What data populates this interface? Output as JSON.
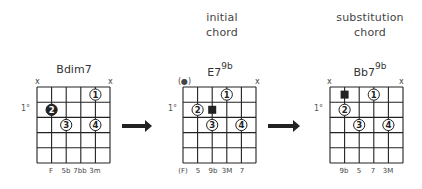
{
  "figure": {
    "arrow_count": 2,
    "colors": {
      "ink": "#222222",
      "background": "#ffffff"
    }
  },
  "diagrams": [
    {
      "id": "bdim7",
      "heading": [],
      "chord_name": "Bdim7",
      "chord_sup": "",
      "fret_label": "1°",
      "top_markers": [
        "x",
        "",
        "",
        "",
        "",
        "x"
      ],
      "bottom_labels": [
        "",
        "F",
        "5b",
        "7bb",
        "3m",
        ""
      ],
      "dots": [
        {
          "string": 4,
          "fret": 1,
          "label": "1",
          "style": "open"
        },
        {
          "string": 1,
          "fret": 2,
          "label": "2",
          "style": "filled"
        },
        {
          "string": 2,
          "fret": 3,
          "label": "3",
          "style": "open"
        },
        {
          "string": 4,
          "fret": 3,
          "label": "4",
          "style": "open"
        }
      ]
    },
    {
      "id": "e7b9",
      "heading": [
        "initial",
        "chord"
      ],
      "chord_name": "E7",
      "chord_sup": "9b",
      "fret_label": "1°",
      "top_markers": [
        "(●)",
        "",
        "",
        "",
        "",
        "x"
      ],
      "bottom_labels": [
        "(F)",
        "5",
        "9b",
        "3M",
        "7",
        ""
      ],
      "dots": [
        {
          "string": 3,
          "fret": 1,
          "label": "1",
          "style": "open"
        },
        {
          "string": 1,
          "fret": 2,
          "label": "2",
          "style": "open"
        },
        {
          "string": 2,
          "fret": 2,
          "label": "",
          "style": "square"
        },
        {
          "string": 2,
          "fret": 3,
          "label": "3",
          "style": "open"
        },
        {
          "string": 4,
          "fret": 3,
          "label": "4",
          "style": "open"
        }
      ]
    },
    {
      "id": "bb7b9",
      "heading": [
        "substitution",
        "chord"
      ],
      "chord_name": "Bb7",
      "chord_sup": "9b",
      "fret_label": "1°",
      "top_markers": [
        "x",
        "",
        "",
        "",
        "",
        "x"
      ],
      "bottom_labels": [
        "",
        "9b",
        "5",
        "7",
        "3M",
        ""
      ],
      "dots": [
        {
          "string": 1,
          "fret": 1,
          "label": "",
          "style": "square"
        },
        {
          "string": 3,
          "fret": 1,
          "label": "1",
          "style": "open"
        },
        {
          "string": 1,
          "fret": 2,
          "label": "2",
          "style": "open"
        },
        {
          "string": 2,
          "fret": 3,
          "label": "3",
          "style": "open"
        },
        {
          "string": 4,
          "fret": 3,
          "label": "4",
          "style": "open"
        }
      ]
    }
  ]
}
